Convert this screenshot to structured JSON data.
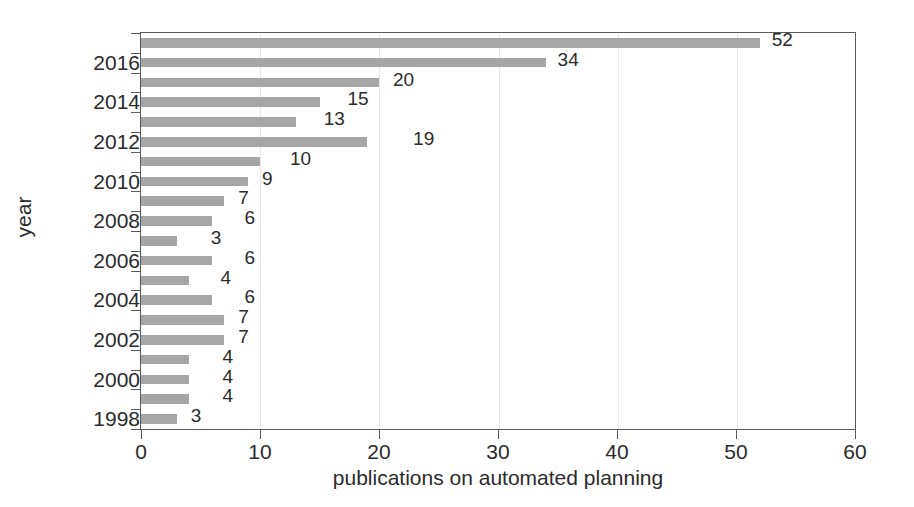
{
  "chart_data": {
    "type": "bar",
    "orientation": "horizontal",
    "title": "",
    "xlabel": "publications on automated planning",
    "ylabel": "year",
    "xlim": [
      0,
      60
    ],
    "xticks": [
      0,
      10,
      20,
      30,
      40,
      50,
      60
    ],
    "ytick_labels": [
      "2016",
      "2014",
      "2012",
      "2010",
      "2008",
      "2006",
      "2004",
      "2002",
      "2000",
      "1998"
    ],
    "grid": "vertical-faint",
    "legend": "none",
    "bar_color": "#a6a6a6",
    "axis_color": "#595959",
    "text_color": "#2b2b2b",
    "categories": [
      "2017",
      "2016",
      "2015",
      "2014",
      "2013",
      "2012",
      "2011",
      "2010",
      "2009",
      "2008",
      "2007",
      "2006",
      "2005",
      "2004",
      "2003",
      "2002",
      "2001",
      "2000",
      "1999",
      "1998"
    ],
    "values": [
      52,
      34,
      20,
      15,
      13,
      19,
      10,
      9,
      7,
      6,
      3,
      6,
      4,
      6,
      7,
      7,
      4,
      4,
      4,
      3
    ],
    "data_labels": [
      "52",
      "34",
      "20",
      "15",
      "13",
      "19",
      "10",
      "9",
      "7",
      "6",
      "3",
      "6",
      "4",
      "6",
      "7",
      "7",
      "4",
      "4",
      "4",
      "3"
    ],
    "label_offsets_px": [
      12,
      12,
      14,
      28,
      28,
      46,
      30,
      14,
      14,
      32,
      34,
      32,
      32,
      32,
      14,
      14,
      34,
      34,
      34,
      14
    ]
  }
}
